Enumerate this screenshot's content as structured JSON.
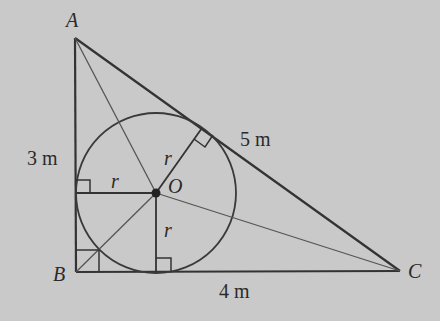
{
  "diagram": {
    "colors": {
      "background": "#c9c9c9",
      "stroke": "#333333",
      "center_dot": "#222222"
    },
    "vertices": {
      "A": {
        "label": "A",
        "x": 74,
        "y": 38
      },
      "B": {
        "label": "B",
        "x": 76,
        "y": 272
      },
      "C": {
        "label": "C",
        "x": 400,
        "y": 271
      }
    },
    "incenter": {
      "label": "O",
      "x": 156,
      "y": 193,
      "radius": 80
    },
    "sides": {
      "AB": {
        "label": "3 m"
      },
      "AC": {
        "label": "5 m"
      },
      "BC": {
        "label": "4 m"
      }
    },
    "radius_labels": {
      "r1": "r",
      "r2": "r",
      "r3": "r"
    }
  }
}
